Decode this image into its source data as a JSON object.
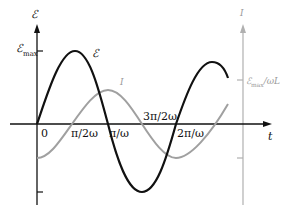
{
  "diagram": {
    "left_axis_label": "ℰ",
    "right_axis_label": "I",
    "horizontal_axis_label": "t",
    "emf_max_label": "ℰ",
    "emf_max_sub": "max",
    "curve_emf_label": "ℰ",
    "curve_current_label": "I",
    "current_max_label": "ℰ",
    "current_max_sub": "max",
    "current_max_suffix": "/ωL",
    "tick_labels": [
      "0",
      "π/2ω",
      "π/ω",
      "3π/2ω",
      "2π/ω"
    ],
    "colors": {
      "emf_curve": "#111111",
      "current_curve": "#a0a0a0",
      "axis": "#111111",
      "current_axis": "#b0b0b0"
    }
  }
}
